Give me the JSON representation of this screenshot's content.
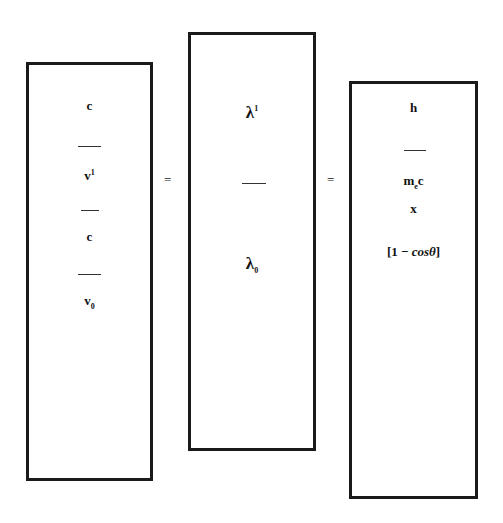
{
  "diagram": {
    "box1": {
      "lines": [
        "c",
        "v",
        "c",
        "v"
      ],
      "v1_sup": "1",
      "v0_sub": "0"
    },
    "box2": {
      "numerator": "λ",
      "numerator_sup": "1",
      "denominator": "λ",
      "denominator_sub": "0"
    },
    "box3": {
      "h": "h",
      "m": "m",
      "m_sub": "e",
      "c": "c",
      "x": "x",
      "bracket_open": "[1 − ",
      "cos": "cosθ",
      "bracket_close": "]"
    },
    "equals": [
      "=",
      "="
    ]
  }
}
